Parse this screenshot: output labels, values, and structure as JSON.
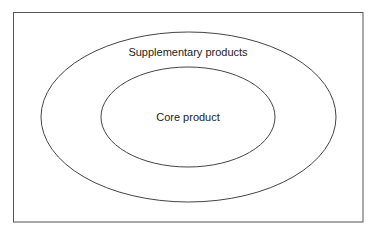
{
  "diagram": {
    "type": "nested-ellipses",
    "outer_label": "Supplementary products",
    "inner_label": "Core product",
    "colors": {
      "background": "#ffffff",
      "stroke": "#444444",
      "frame": "#555555",
      "text": "#222222"
    },
    "layers": [
      {
        "name": "Supplementary products",
        "level": "outer"
      },
      {
        "name": "Core product",
        "level": "inner"
      }
    ]
  }
}
